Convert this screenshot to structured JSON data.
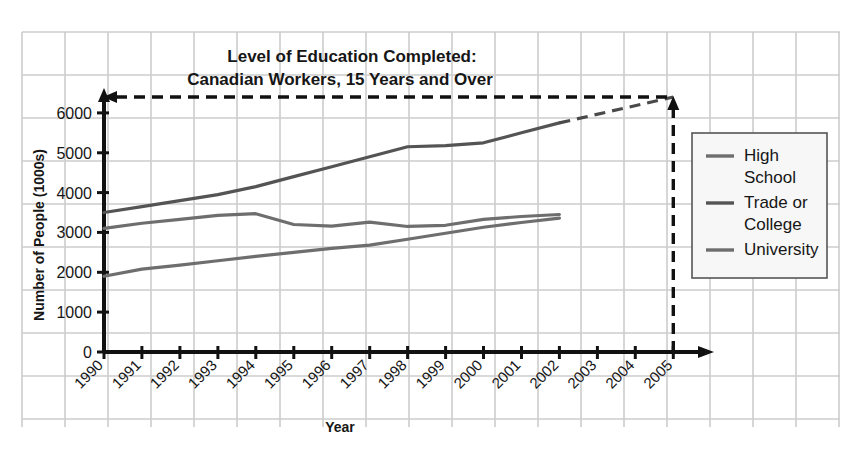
{
  "chart_data": {
    "type": "line",
    "title": "Level of Education Completed:",
    "subtitle": "Canadian Workers, 15 Years and Over",
    "xlabel": "Year",
    "ylabel": "Number of People (1000s)",
    "grid": true,
    "legend_position": "right",
    "xlim": [
      1990,
      2005
    ],
    "ylim": [
      0,
      6500
    ],
    "ytick_labels": [
      "0",
      "1000",
      "2000",
      "3000",
      "4000",
      "5000",
      "6000"
    ],
    "ytick_values": [
      0,
      1000,
      2000,
      3000,
      4000,
      5000,
      6000
    ],
    "xtick_labels": [
      "1990",
      "1991",
      "1992",
      "1993",
      "1994",
      "1995",
      "1996",
      "1997",
      "1998",
      "1999",
      "2000",
      "2001",
      "2002",
      "2003",
      "2004",
      "2005"
    ],
    "categories": [
      1990,
      1991,
      1992,
      1993,
      1994,
      1995,
      1996,
      1997,
      1998,
      1999,
      2000,
      2001,
      2002
    ],
    "series": [
      {
        "name": "High School",
        "legend_label_line1": "High",
        "legend_label_line2": "School",
        "color": "#6e6e6e",
        "values": [
          3100,
          3230,
          3330,
          3430,
          3470,
          3200,
          3160,
          3260,
          3150,
          3180,
          3330,
          3400,
          3450
        ]
      },
      {
        "name": "Trade or College",
        "legend_label_line1": "Trade or",
        "legend_label_line2": "College",
        "color": "#545454",
        "values": [
          3500,
          3650,
          3800,
          3950,
          4150,
          4400,
          4650,
          4900,
          5150,
          5180,
          5250,
          5500,
          5750
        ]
      },
      {
        "name": "University",
        "legend_label_line1": "University",
        "legend_label_line2": "",
        "color": "#6e6e6e",
        "values": [
          1900,
          2080,
          2180,
          2290,
          2400,
          2500,
          2600,
          2680,
          2830,
          2980,
          3130,
          3250,
          3360
        ]
      }
    ],
    "projection": {
      "series": "Trade or College",
      "from_year": 2002,
      "to_year": 2005,
      "to_value": 6400,
      "style": "dashed"
    },
    "annotations": [
      {
        "name": "projection-vertical-arrow",
        "x_year": 2005,
        "style": "dashed",
        "direction": "up"
      },
      {
        "name": "projection-horizontal-arrow",
        "y_value": 6400,
        "style": "dashed",
        "direction": "left"
      }
    ]
  },
  "axis": {
    "y_label": "Number of People (1000s)",
    "x_label": "Year"
  },
  "legend": {
    "items": [
      {
        "line1": "High",
        "line2": "School"
      },
      {
        "line1": "Trade or",
        "line2": "College"
      },
      {
        "line1": "University",
        "line2": ""
      }
    ]
  },
  "colors": {
    "grid": "#cccccc",
    "axis": "#111111",
    "line_light": "#6e6e6e",
    "line_dark": "#545454",
    "legend_bg": "#f7f7f7",
    "legend_border": "#555555"
  }
}
